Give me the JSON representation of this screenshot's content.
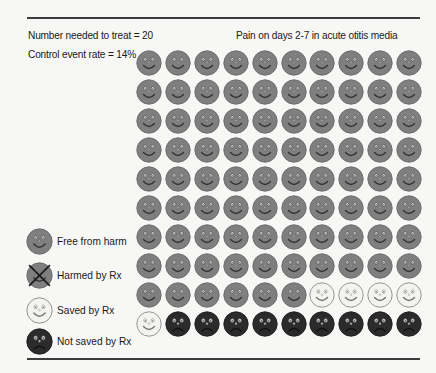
{
  "header": {
    "nnt_label": "Number needed to treat = 20",
    "cer_label": "Control event rate = 14%",
    "title": "Pain on days 2-7 in acute otitis media"
  },
  "legend": [
    {
      "key": "free",
      "label": "Free from harm",
      "icon": "smiley-grey-icon"
    },
    {
      "key": "harmed",
      "label": "Harmed by Rx",
      "icon": "smiley-crossed-icon"
    },
    {
      "key": "saved",
      "label": "Saved by Rx",
      "icon": "smiley-light-icon"
    },
    {
      "key": "notsaved",
      "label": "Not saved by Rx",
      "icon": "frowny-dark-icon"
    }
  ],
  "colors": {
    "free": "#7f7f7f",
    "free_stroke": "#6a6a6a",
    "saved": "#f3f3f1",
    "saved_stroke": "#8a8a8a",
    "notsaved": "#2b2b2b",
    "notsaved_stroke": "#1e1e1e",
    "rule": "#3c3c3c"
  },
  "chart_data": {
    "type": "icon-array",
    "title": "Pain on days 2-7 in acute otitis media",
    "annotations": [
      "Number needed to treat = 20",
      "Control event rate = 14%"
    ],
    "rows": 10,
    "cols": 10,
    "total": 100,
    "counts": {
      "Free from harm": 86,
      "Harmed by Rx": 0,
      "Saved by Rx": 5,
      "Not saved by Rx": 9
    },
    "legend": [
      "Free from harm",
      "Harmed by Rx",
      "Saved by Rx",
      "Not saved by Rx"
    ],
    "grid": [
      [
        "free",
        "free",
        "free",
        "free",
        "free",
        "free",
        "free",
        "free",
        "free",
        "free"
      ],
      [
        "free",
        "free",
        "free",
        "free",
        "free",
        "free",
        "free",
        "free",
        "free",
        "free"
      ],
      [
        "free",
        "free",
        "free",
        "free",
        "free",
        "free",
        "free",
        "free",
        "free",
        "free"
      ],
      [
        "free",
        "free",
        "free",
        "free",
        "free",
        "free",
        "free",
        "free",
        "free",
        "free"
      ],
      [
        "free",
        "free",
        "free",
        "free",
        "free",
        "free",
        "free",
        "free",
        "free",
        "free"
      ],
      [
        "free",
        "free",
        "free",
        "free",
        "free",
        "free",
        "free",
        "free",
        "free",
        "free"
      ],
      [
        "free",
        "free",
        "free",
        "free",
        "free",
        "free",
        "free",
        "free",
        "free",
        "free"
      ],
      [
        "free",
        "free",
        "free",
        "free",
        "free",
        "free",
        "free",
        "free",
        "free",
        "free"
      ],
      [
        "free",
        "free",
        "free",
        "free",
        "free",
        "free",
        "saved",
        "saved",
        "saved",
        "saved"
      ],
      [
        "saved",
        "notsaved",
        "notsaved",
        "notsaved",
        "notsaved",
        "notsaved",
        "notsaved",
        "notsaved",
        "notsaved",
        "notsaved"
      ]
    ]
  }
}
